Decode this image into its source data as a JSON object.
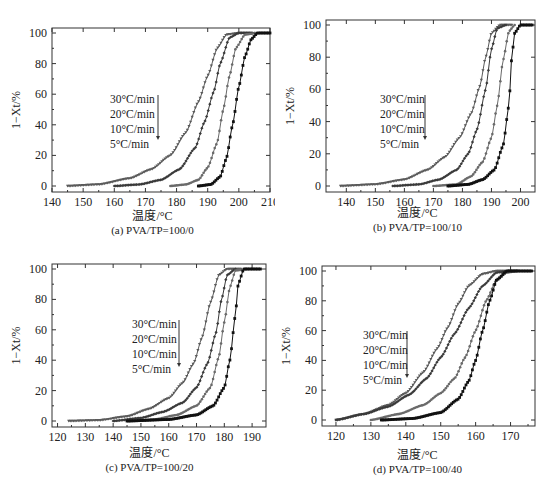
{
  "figure": {
    "ylabel": "1−Xt/%",
    "xlabel": "温度/°C",
    "legend": [
      "30°C/min",
      "20°C/min",
      "10°C/min",
      "5°C/min"
    ]
  },
  "chart_data": [
    {
      "type": "scatter",
      "title": "(a) PVA/TP=100/0",
      "xlabel": "温度/°C",
      "ylabel": "1−Xt/%",
      "xlim": [
        140,
        210
      ],
      "ylim": [
        0,
        100
      ],
      "xticks": [
        140,
        150,
        160,
        170,
        180,
        190,
        200,
        210
      ],
      "yticks": [
        0,
        20,
        40,
        60,
        80,
        100
      ],
      "legend": [
        "30°C/min",
        "20°C/min",
        "10°C/min",
        "5°C/min"
      ],
      "series": [
        {
          "name": "30°C/min",
          "x": [
            145,
            155,
            165,
            172,
            178,
            183,
            187,
            190,
            193,
            196,
            200,
            204
          ],
          "y": [
            0,
            1,
            5,
            11,
            20,
            35,
            55,
            72,
            90,
            99,
            100,
            100
          ]
        },
        {
          "name": "20°C/min",
          "x": [
            160,
            168,
            175,
            181,
            186,
            189,
            192,
            194,
            197,
            200,
            205
          ],
          "y": [
            0,
            1,
            4,
            11,
            25,
            42,
            62,
            80,
            97,
            100,
            100
          ]
        },
        {
          "name": "10°C/min",
          "x": [
            178,
            183,
            187,
            190,
            193,
            195,
            197,
            199,
            202,
            206
          ],
          "y": [
            0,
            1,
            4,
            12,
            28,
            50,
            72,
            90,
            99,
            100
          ]
        },
        {
          "name": "5°C/min",
          "x": [
            187,
            191,
            194,
            196,
            198,
            200,
            202,
            204,
            206,
            210
          ],
          "y": [
            0,
            1,
            6,
            18,
            40,
            65,
            85,
            96,
            100,
            100
          ]
        }
      ]
    },
    {
      "type": "scatter",
      "title": "(b) PVA/TP=100/10",
      "xlabel": "温度/°C",
      "ylabel": "1−Xt/%",
      "xlim": [
        133,
        205
      ],
      "ylim": [
        0,
        100
      ],
      "xticks": [
        140,
        150,
        160,
        170,
        180,
        190,
        200
      ],
      "yticks": [
        0,
        20,
        40,
        60,
        80,
        100
      ],
      "legend": [
        "30°C/min",
        "20°C/min",
        "10°C/min",
        "5°C/min"
      ],
      "series": [
        {
          "name": "30°C/min",
          "x": [
            138,
            150,
            160,
            168,
            174,
            179,
            183,
            186,
            188,
            190,
            193,
            197
          ],
          "y": [
            0,
            1,
            4,
            10,
            18,
            30,
            45,
            62,
            80,
            95,
            100,
            100
          ]
        },
        {
          "name": "20°C/min",
          "x": [
            156,
            165,
            172,
            178,
            182,
            185,
            188,
            190,
            192,
            195
          ],
          "y": [
            0,
            1,
            4,
            10,
            20,
            35,
            60,
            85,
            98,
            100
          ]
        },
        {
          "name": "10°C/min",
          "x": [
            170,
            178,
            183,
            187,
            190,
            192,
            194,
            196,
            198
          ],
          "y": [
            0,
            1,
            6,
            15,
            30,
            50,
            78,
            96,
            100
          ]
        },
        {
          "name": "5°C/min",
          "x": [
            175,
            182,
            187,
            191,
            194,
            196,
            197,
            198,
            200,
            204
          ],
          "y": [
            0,
            1,
            4,
            10,
            25,
            50,
            80,
            95,
            100,
            100
          ]
        }
      ]
    },
    {
      "type": "scatter",
      "title": "(c) PVA/TP=100/20",
      "xlabel": "温度/°C",
      "ylabel": "1−Xt/%",
      "xlim": [
        118,
        195
      ],
      "ylim": [
        0,
        100
      ],
      "xticks": [
        120,
        130,
        140,
        150,
        160,
        170,
        180,
        190
      ],
      "yticks": [
        0,
        20,
        40,
        60,
        80,
        100
      ],
      "legend": [
        "30°C/min",
        "20°C/min",
        "10°C/min",
        "5°C/min"
      ],
      "series": [
        {
          "name": "30°C/min",
          "x": [
            124,
            135,
            145,
            153,
            160,
            165,
            169,
            172,
            175,
            178,
            181,
            186
          ],
          "y": [
            0,
            0.5,
            3,
            8,
            15,
            25,
            38,
            55,
            78,
            96,
            100,
            100
          ]
        },
        {
          "name": "20°C/min",
          "x": [
            140,
            150,
            158,
            165,
            170,
            174,
            177,
            179,
            181,
            184
          ],
          "y": [
            0,
            2,
            6,
            12,
            22,
            38,
            58,
            80,
            96,
            100
          ]
        },
        {
          "name": "10°C/min",
          "x": [
            145,
            155,
            163,
            170,
            175,
            178,
            180,
            182,
            184,
            188
          ],
          "y": [
            0,
            1,
            4,
            10,
            22,
            42,
            65,
            88,
            99,
            100
          ]
        },
        {
          "name": "5°C/min",
          "x": [
            145,
            160,
            170,
            176,
            180,
            182,
            184,
            185,
            187,
            193
          ],
          "y": [
            0,
            1,
            4,
            10,
            22,
            40,
            70,
            90,
            100,
            100
          ]
        }
      ]
    },
    {
      "type": "scatter",
      "title": "(d) PVA/TP=100/40",
      "xlabel": "温度/°C",
      "ylabel": "1−Xt/%",
      "xlim": [
        116,
        177
      ],
      "ylim": [
        0,
        100
      ],
      "xticks": [
        120,
        130,
        140,
        150,
        160,
        170
      ],
      "yticks": [
        0,
        20,
        40,
        60,
        80,
        100
      ],
      "legend": [
        "30°C/min",
        "20°C/min",
        "10°C/min",
        "5°C/min"
      ],
      "series": [
        {
          "name": "30°C/min",
          "x": [
            120,
            128,
            135,
            140,
            145,
            149,
            152,
            155,
            158,
            162,
            166,
            172
          ],
          "y": [
            0,
            4,
            10,
            18,
            32,
            48,
            62,
            78,
            90,
            98,
            100,
            100
          ]
        },
        {
          "name": "20°C/min",
          "x": [
            120,
            128,
            135,
            141,
            146,
            150,
            154,
            158,
            162,
            166,
            170
          ],
          "y": [
            0,
            4,
            9,
            17,
            28,
            42,
            58,
            75,
            90,
            99,
            100
          ]
        },
        {
          "name": "10°C/min",
          "x": [
            130,
            138,
            145,
            150,
            154,
            157,
            160,
            163,
            166,
            169,
            172
          ],
          "y": [
            0,
            4,
            10,
            18,
            28,
            42,
            60,
            80,
            94,
            99,
            100
          ]
        },
        {
          "name": "5°C/min",
          "x": [
            133,
            142,
            150,
            155,
            158,
            160,
            162,
            164,
            166,
            169,
            176
          ],
          "y": [
            0,
            1,
            5,
            14,
            26,
            40,
            60,
            80,
            94,
            100,
            100
          ]
        }
      ]
    }
  ]
}
